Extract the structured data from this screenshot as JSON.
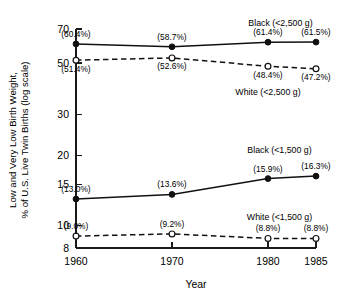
{
  "chart_data": {
    "type": "line",
    "title": "",
    "xlabel": "Year",
    "ylabel": "Low and Very Low Birth Weight, % of U.S. Live Twin Births (log scale)",
    "ylabel_line1": "Low and Very Low Birth Weight,",
    "ylabel_line2": "% of U.S. Live Twin Births  (log scale)",
    "yscale": "log",
    "ylim": [
      8,
      70
    ],
    "xlim": [
      1960,
      1985
    ],
    "grid": false,
    "legend_position": "inline-annotations",
    "x": [
      1960,
      1970,
      1980,
      1985
    ],
    "xtick_labels": [
      "1960",
      "1970",
      "1980",
      "1985"
    ],
    "ytick_values": [
      70,
      50,
      30,
      20,
      15,
      10,
      8
    ],
    "ytick_labels": [
      "70",
      "50",
      "30",
      "20",
      "15",
      "10",
      "8"
    ],
    "series": [
      {
        "name": "Black  (<2,500 g)",
        "label": "Black  (<2,500 g)",
        "marker": "filled-circle",
        "linestyle": "solid",
        "color": "#111111",
        "values": [
          60.4,
          58.7,
          61.4,
          61.5
        ],
        "value_labels": [
          "(60.4%)",
          "(58.7%)",
          "(61.4%)",
          "(61.5%)"
        ],
        "label_side": "above",
        "series_label_x": 1981.3,
        "series_label_y": 72.5
      },
      {
        "name": "White  (<2,500 g)",
        "label": "White  (<2,500 g)",
        "marker": "open-circle",
        "linestyle": "dashed",
        "color": "#111111",
        "values": [
          51.4,
          52.6,
          48.4,
          47.2
        ],
        "value_labels": [
          "(51.4%)",
          "(52.6%)",
          "(48.4%)",
          "(47.2%)"
        ],
        "label_side": "below",
        "series_label_x": 1980.0,
        "series_label_y": 36.5
      },
      {
        "name": "Black  (<1,500 g)",
        "label": "Black  (<1,500 g)",
        "marker": "filled-circle",
        "linestyle": "solid",
        "color": "#111111",
        "values": [
          13.0,
          13.6,
          15.9,
          16.3
        ],
        "value_labels": [
          "(13.0%)",
          "(13.6%)",
          "(15.9%)",
          "(16.3%)"
        ],
        "label_side": "above",
        "series_label_x": 1981.2,
        "series_label_y": 20.6
      },
      {
        "name": "White  (<1,500 g)",
        "label": "White  (<1,500 g)",
        "marker": "open-circle",
        "linestyle": "dashed",
        "color": "#111111",
        "values": [
          9.0,
          9.2,
          8.8,
          8.8
        ],
        "value_labels": [
          "(9.0%)",
          "(9.2%)",
          "(8.8%)",
          "(8.8%)"
        ],
        "label_side": "above",
        "series_label_x": 1981.2,
        "series_label_y": 10.55
      }
    ]
  }
}
